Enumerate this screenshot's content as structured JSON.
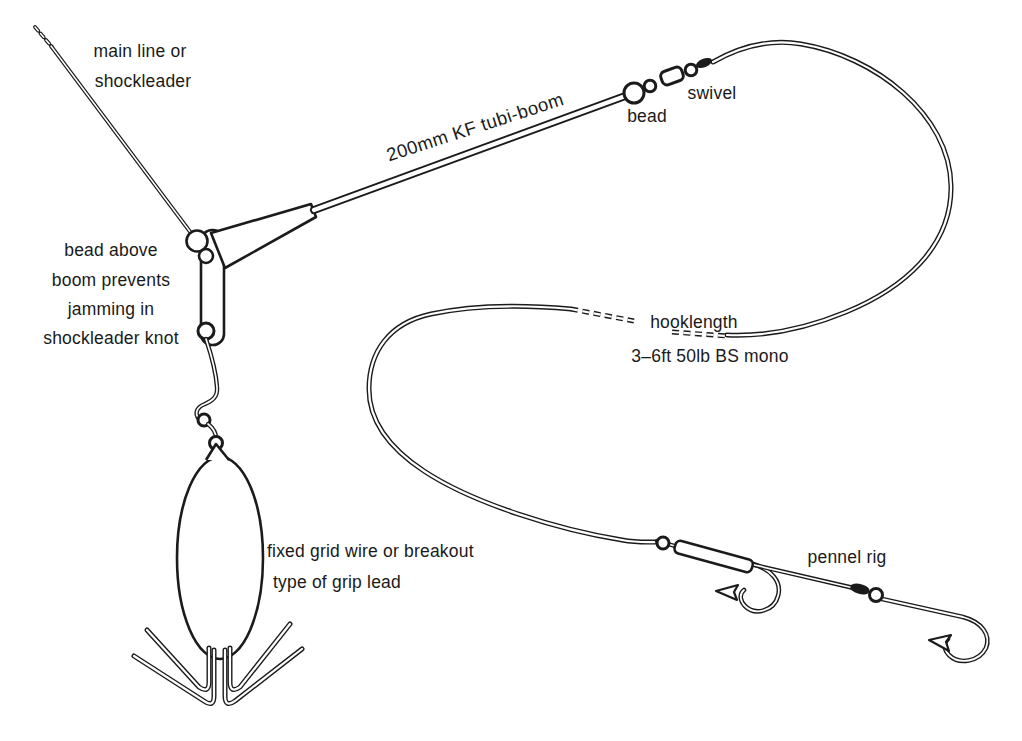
{
  "figure": {
    "name": "tubi-boom fishing rig diagram",
    "background_color": "#ffffff",
    "ink_color": "#1b1b1b"
  },
  "labels": {
    "main_line": {
      "lines": [
        "main line or",
        "shockleader"
      ]
    },
    "tubi_boom": {
      "text": "200mm KF tubi-boom"
    },
    "bead": {
      "text": "bead"
    },
    "swivel": {
      "text": "swivel"
    },
    "bead_above_boom": {
      "lines": [
        "bead above",
        "boom prevents",
        "jamming in",
        "shockleader knot"
      ]
    },
    "hooklength": {
      "line1": "hooklength",
      "line2": "3–6ft 50lb BS mono"
    },
    "grip_lead": {
      "lines": [
        "fixed grid wire or breakout",
        "type of grip lead"
      ]
    },
    "pennel": {
      "text": "pennel rig"
    }
  }
}
